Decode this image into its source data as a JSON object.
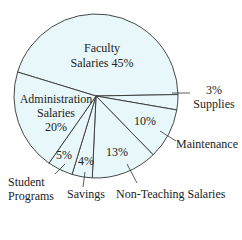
{
  "chart_data": {
    "type": "pie",
    "title": "",
    "categories": [
      "Faculty Salaries",
      "Supplies",
      "Maintenance",
      "Non-Teaching Salaries",
      "Savings",
      "Student Programs",
      "Administration Salaries"
    ],
    "values": [
      45,
      3,
      10,
      13,
      4,
      5,
      20
    ],
    "unit": "%",
    "fill_color": "#e8f7f9",
    "stroke_color": "#333333"
  },
  "labels": {
    "faculty_line1": "Faculty",
    "faculty_line2": "Salaries 45%",
    "admin_line1": "Administration",
    "admin_line2": "Salaries",
    "admin_pct": "20%",
    "supplies_pct": "3%",
    "supplies_name": "Supplies",
    "maintenance_pct": "10%",
    "maintenance_name": "Maintenance",
    "nonteaching_pct": "13%",
    "nonteaching_name": "Non-Teaching Salaries",
    "savings_pct": "4%",
    "savings_name": "Savings",
    "student_pct": "5%",
    "student_name_line1": "Student",
    "student_name_line2": "Programs"
  }
}
